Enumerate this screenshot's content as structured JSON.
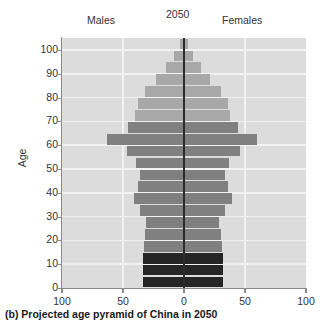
{
  "header": {
    "males_label": "Males",
    "year_label": "2050",
    "females_label": "Females"
  },
  "caption": "(b) Projected age pyramid of China in 2050",
  "chart_data": {
    "type": "bar",
    "subtype": "population-pyramid",
    "title": "2050",
    "xlabel": "",
    "ylabel": "Age",
    "grid": true,
    "legend_position": "none",
    "xlim": [
      -100,
      100
    ],
    "xtick_labels": [
      "100",
      "50",
      "0",
      "50",
      "100"
    ],
    "xtick_values": [
      -100,
      -50,
      0,
      50,
      100
    ],
    "ylim": [
      0,
      105
    ],
    "ytick_labels": [
      "0",
      "10",
      "20",
      "30",
      "40",
      "50",
      "60",
      "70",
      "80",
      "90",
      "100"
    ],
    "ytick_values": [
      0,
      10,
      20,
      30,
      40,
      50,
      60,
      70,
      80,
      90,
      100
    ],
    "categories": [
      "0-4",
      "5-9",
      "10-14",
      "15-19",
      "20-24",
      "25-29",
      "30-34",
      "35-39",
      "40-44",
      "45-49",
      "50-54",
      "55-59",
      "60-64",
      "65-69",
      "70-74",
      "75-79",
      "80-84",
      "85-89",
      "90-94",
      "95-99",
      "100-104"
    ],
    "colors": {
      "young_band": "#252525",
      "main_band": "#808080",
      "light_band": "#a8a8a8",
      "plot_background": "#dcdcdc",
      "gridline": "#f2f2f2",
      "centerline": "#2b2b2b",
      "axis": "#8a8a8a"
    },
    "series": [
      {
        "name": "Males",
        "side": "left",
        "values": [
          34,
          34,
          34,
          33,
          32,
          31,
          36,
          41,
          38,
          36,
          39,
          47,
          63,
          46,
          40,
          38,
          32,
          23,
          15,
          8,
          3
        ]
      },
      {
        "name": "Females",
        "side": "right",
        "values": [
          32,
          32,
          32,
          31,
          30,
          29,
          34,
          39,
          36,
          34,
          37,
          46,
          60,
          44,
          38,
          36,
          30,
          21,
          14,
          7,
          3
        ]
      }
    ],
    "band_shading": [
      {
        "category": "0-4",
        "tone": "young_band"
      },
      {
        "category": "5-9",
        "tone": "young_band"
      },
      {
        "category": "10-14",
        "tone": "young_band"
      },
      {
        "category": "15-19",
        "tone": "main_band"
      },
      {
        "category": "20-24",
        "tone": "main_band"
      },
      {
        "category": "25-29",
        "tone": "main_band"
      },
      {
        "category": "30-34",
        "tone": "main_band"
      },
      {
        "category": "35-39",
        "tone": "main_band"
      },
      {
        "category": "40-44",
        "tone": "main_band"
      },
      {
        "category": "45-49",
        "tone": "main_band"
      },
      {
        "category": "50-54",
        "tone": "main_band"
      },
      {
        "category": "55-59",
        "tone": "main_band"
      },
      {
        "category": "60-64",
        "tone": "main_band"
      },
      {
        "category": "65-69",
        "tone": "main_band"
      },
      {
        "category": "70-74",
        "tone": "light_band"
      },
      {
        "category": "75-79",
        "tone": "light_band"
      },
      {
        "category": "80-84",
        "tone": "light_band"
      },
      {
        "category": "85-89",
        "tone": "light_band"
      },
      {
        "category": "90-94",
        "tone": "light_band"
      },
      {
        "category": "95-99",
        "tone": "light_band"
      },
      {
        "category": "100-104",
        "tone": "light_band"
      }
    ]
  }
}
